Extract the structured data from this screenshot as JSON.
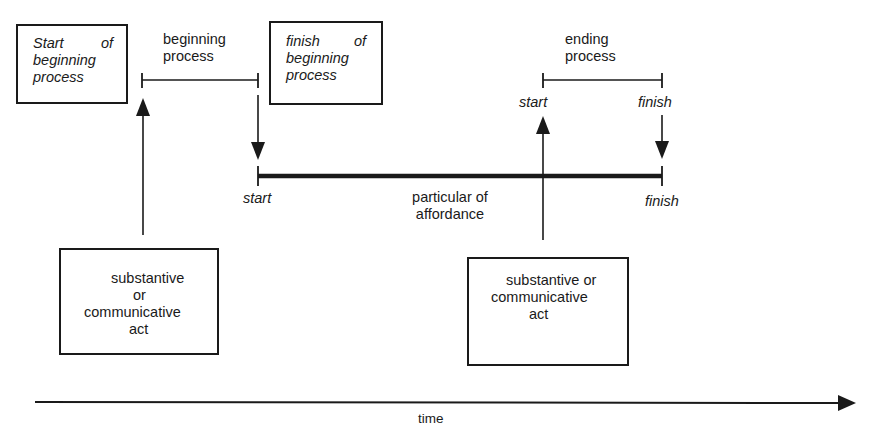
{
  "diagram": {
    "type": "timeline-process-diagram",
    "colors": {
      "ink": "#1a1a1a",
      "background": "#ffffff"
    },
    "boxes": {
      "start_of_beginning": {
        "line1a": "Start",
        "line1b": "of",
        "line2": "beginning",
        "line3": "process"
      },
      "finish_of_beginning": {
        "line1a": "finish",
        "line1b": "of",
        "line2": "beginning",
        "line3": "process"
      },
      "left_act": {
        "line1": "substantive",
        "line2": "or",
        "line3": "communicative",
        "line4": "act"
      },
      "right_act": {
        "line1": "substantive or",
        "line2": "communicative",
        "line3": "act"
      }
    },
    "brackets": {
      "beginning_process": {
        "line1": "beginning",
        "line2": "process"
      },
      "ending_process": {
        "line1": "ending",
        "line2": "process",
        "start_label": "start",
        "finish_label": "finish"
      }
    },
    "affordance_bar": {
      "start_label": "start",
      "label_line1": "particular of",
      "label_line2": "affordance",
      "finish_label": "finish"
    },
    "time_axis": {
      "label": "time"
    }
  }
}
